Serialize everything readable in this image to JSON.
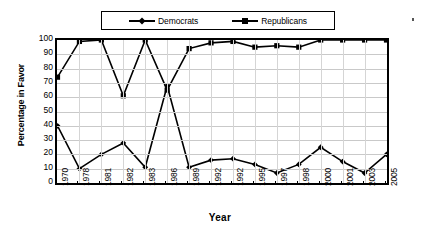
{
  "chart_data": {
    "type": "line",
    "title": "",
    "xlabel": "Year",
    "ylabel": "Percentage in Favor",
    "ylim": [
      0,
      100
    ],
    "ytick_step": 10,
    "yticks": [
      100,
      90,
      80,
      70,
      60,
      50,
      40,
      30,
      20,
      10,
      0
    ],
    "grid": true,
    "grid_orientation": "both",
    "legend_position": "top",
    "categories": [
      "1970",
      "1978",
      "1981",
      "1982",
      "1983",
      "1986",
      "1989",
      "1992",
      "1992",
      "1995",
      "1997",
      "1998",
      "2000",
      "2001",
      "2003",
      "2005"
    ],
    "series": [
      {
        "name": "Democrats",
        "marker": "diamond",
        "color": "#000000",
        "values": [
          40,
          10,
          20,
          28,
          11,
          68,
          11,
          16,
          17,
          13,
          7,
          13,
          25,
          15,
          7,
          20
        ]
      },
      {
        "name": "Republicans",
        "marker": "square",
        "color": "#000000",
        "values": [
          74,
          99,
          100,
          61,
          100,
          65,
          94,
          98,
          99,
          95,
          96,
          95,
          100,
          100,
          100,
          100
        ]
      }
    ]
  },
  "legend": {
    "entries": [
      {
        "label": "Democrats",
        "marker": "diamond"
      },
      {
        "label": "Republicans",
        "marker": "square"
      }
    ]
  },
  "axes": {
    "x_title": "Year",
    "y_title": "Percentage in Favor"
  },
  "colors": {
    "ink": "#000000",
    "grid": "#c9c9c9",
    "background": "#ffffff"
  }
}
